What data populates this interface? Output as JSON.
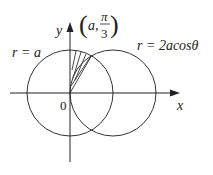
{
  "figure": {
    "axes": {
      "x_label": "x",
      "y_label": "y",
      "origin_label": "0"
    },
    "curves": [
      {
        "name": "circle-1",
        "label": "r = a",
        "equation": "r = a"
      },
      {
        "name": "circle-2",
        "label": "r = 2acosθ",
        "equation": "r = 2a cos θ"
      }
    ],
    "point_label": {
      "open": "(",
      "a": "a,",
      "numerator": "π",
      "denominator": "3",
      "close": ")"
    },
    "colors": {
      "stroke": "#333333",
      "background": "#ffffff"
    }
  }
}
